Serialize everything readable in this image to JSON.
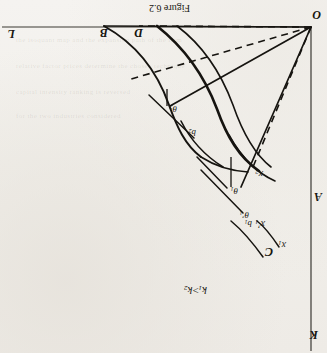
{
  "figure": {
    "caption": "Figure 6.2",
    "condition_label": "k₁ > k₂",
    "condition_parts": {
      "k": "k",
      "sub1": "1",
      "rel": ">",
      "sub2": "2"
    }
  },
  "axes": {
    "vertical_label": "L",
    "horizontal_label": "K",
    "origin_label": "O"
  },
  "points": [
    {
      "id": "O",
      "label": "O",
      "x": 311,
      "y": 27,
      "role": "origin"
    },
    {
      "id": "A",
      "label": "A",
      "x": 311,
      "y": 196,
      "role": "axis-point"
    },
    {
      "id": "B",
      "label": "B",
      "x": 104,
      "y": 26,
      "role": "axis-point"
    },
    {
      "id": "C",
      "label": "C",
      "x": 266,
      "y": 246,
      "role": "curve-endpoint"
    },
    {
      "id": "D",
      "label": "D",
      "x": 139,
      "y": 26,
      "role": "axis-point"
    }
  ],
  "curves": [
    {
      "id": "x1",
      "label": "x₁",
      "base": "x",
      "sub": "1",
      "prime": false
    },
    {
      "id": "x1prime",
      "label": "x₁′",
      "base": "x",
      "sub": "1",
      "prime": true
    },
    {
      "id": "x2",
      "label": "x₂",
      "base": "x",
      "sub": "2",
      "prime": false
    }
  ],
  "angles": [
    {
      "id": "theta1",
      "label": "θ₁",
      "base": "θ",
      "sub": "1",
      "prime": false
    },
    {
      "id": "theta1prime",
      "label": "θ₁′",
      "base": "θ",
      "sub": "1",
      "prime": true
    },
    {
      "id": "theta2",
      "label": "θ₂",
      "base": "θ",
      "sub": "2",
      "prime": false
    }
  ],
  "tangency": [
    {
      "id": "b1",
      "label": "b₁",
      "base": "b",
      "sub": "1"
    },
    {
      "id": "b2",
      "label": "b₂",
      "base": "b",
      "sub": "2"
    }
  ],
  "style": {
    "ink": "#161410",
    "paper": "#f3f1ee",
    "axis_color": "#3a3833",
    "stroke_main": 1.6,
    "stroke_axis": 1.2,
    "dash_pattern": "7 5"
  },
  "page_bleed": [
    {
      "text": "the isoquant map and the expansion path of the firm",
      "x": 16,
      "y": 36
    },
    {
      "text": "relative factor prices determine the chosen technique",
      "x": 16,
      "y": 62
    },
    {
      "text": "capital intensity ranking is reversed",
      "x": 16,
      "y": 88
    },
    {
      "text": "for the two industries considered",
      "x": 16,
      "y": 112
    }
  ]
}
